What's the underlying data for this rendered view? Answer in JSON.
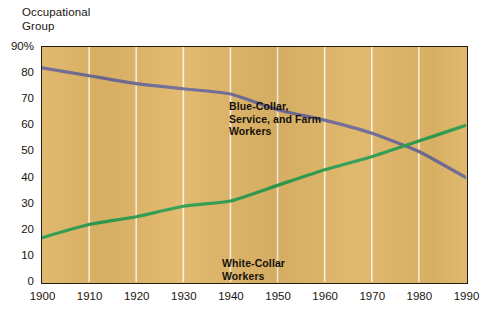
{
  "axis_title": "Occupational\nGroup",
  "series_labels": {
    "blue_collar": "Blue-Collar,\nService, and Farm\nWorkers",
    "white_collar": "White-Collar\nWorkers"
  },
  "colors": {
    "plot_background": "#e0b667",
    "frame": "#231a10",
    "gridline": "#fbf2e0",
    "blue_collar_line": "#6f6a93",
    "white_collar_line": "#2e9d4f",
    "text": "#19140f"
  },
  "chart_data": {
    "type": "line",
    "title": "Occupational Group",
    "xlabel": "",
    "ylabel": "Occupational Group",
    "x": [
      1900,
      1910,
      1920,
      1930,
      1940,
      1950,
      1960,
      1970,
      1980,
      1990
    ],
    "xtick_labels": [
      "1900",
      "1910",
      "1920",
      "1930",
      "1940",
      "1950",
      "1960",
      "1970",
      "1980",
      "1990"
    ],
    "ytick_labels": [
      "90%",
      "80",
      "70",
      "60",
      "50",
      "40",
      "30",
      "20",
      "10",
      "0"
    ],
    "ytick_values": [
      90,
      80,
      70,
      60,
      50,
      40,
      30,
      20,
      10,
      0
    ],
    "xlim": [
      1900,
      1990
    ],
    "ylim": [
      0,
      90
    ],
    "grid": "vertical",
    "legend": "inline-annotations",
    "series": [
      {
        "name": "Blue-Collar, Service, and Farm Workers",
        "color": "#6f6a93",
        "values": [
          82,
          79,
          76,
          74,
          72,
          66,
          62,
          57,
          50,
          40
        ]
      },
      {
        "name": "White-Collar Workers",
        "color": "#2e9d4f",
        "values": [
          17,
          22,
          25,
          29,
          31,
          37,
          43,
          48,
          54,
          60
        ]
      }
    ],
    "annotations": [
      {
        "text": "Blue-Collar, Service, and Farm Workers",
        "near_x": 1930,
        "near_y": 85
      },
      {
        "text": "White-Collar Workers",
        "near_x": 1930,
        "near_y": 28
      }
    ]
  }
}
